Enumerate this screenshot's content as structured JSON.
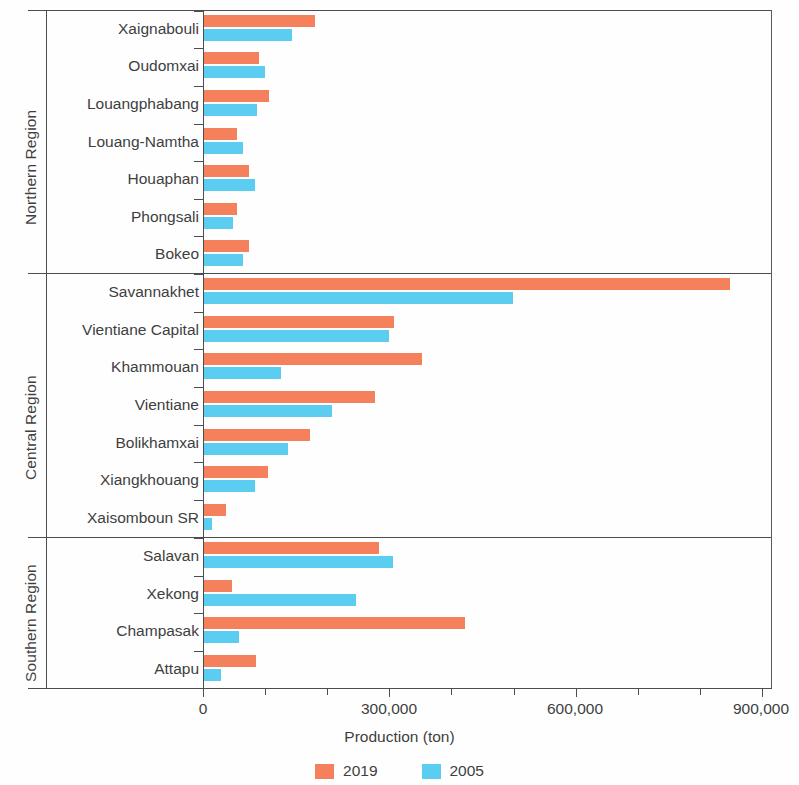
{
  "chart_data": {
    "type": "bar",
    "orientation": "horizontal",
    "title": "",
    "xlabel": "Production (ton)",
    "ylabel": "",
    "xlim": [
      0,
      900000
    ],
    "xticks": [
      0,
      100000,
      200000,
      300000,
      400000,
      500000,
      600000,
      700000,
      800000,
      900000
    ],
    "xtick_labels": [
      "0",
      "300,000",
      "600,000",
      "900,000"
    ],
    "major_xticks": [
      0,
      300000,
      600000,
      900000
    ],
    "grid": false,
    "legend_position": "bottom",
    "series": [
      {
        "name": "2019",
        "color": "#f4805c"
      },
      {
        "name": "2005",
        "color": "#5bcdf0"
      }
    ],
    "groups": [
      {
        "region": "Northern Region",
        "categories": [
          "Xaignabouli",
          "Oudomxai",
          "Louangphabang",
          "Louang-Namtha",
          "Houaphan",
          "Phongsali",
          "Bokeo"
        ],
        "values_2019": [
          178000,
          89000,
          104000,
          53000,
          72000,
          53000,
          72000
        ],
        "values_2005": [
          142000,
          98000,
          85000,
          63000,
          82000,
          47000,
          63000
        ]
      },
      {
        "region": "Central Region",
        "categories": [
          "Savannakhet",
          "Vientiane Capital",
          "Khammouan",
          "Vientiane",
          "Bolikhamxai",
          "Xiangkhouang",
          "Xaisomboun SR"
        ],
        "values_2019": [
          847000,
          306000,
          351000,
          275000,
          171000,
          103000,
          35000
        ],
        "values_2005": [
          497000,
          298000,
          124000,
          206000,
          135000,
          82000,
          13000
        ]
      },
      {
        "region": "Southern Region",
        "categories": [
          "Salavan",
          "Xekong",
          "Champasak",
          "Attapu"
        ],
        "values_2019": [
          282000,
          45000,
          420000,
          84000
        ],
        "values_2005": [
          304000,
          245000,
          56000,
          27000
        ]
      }
    ]
  },
  "axis": {
    "x_title": "Production (ton)",
    "tick_0": "0",
    "tick_300k": "300,000",
    "tick_600k": "600,000",
    "tick_900k": "900,000"
  },
  "legend": {
    "items": [
      {
        "label": "2019",
        "color": "#f4805c"
      },
      {
        "label": "2005",
        "color": "#5bcdf0"
      }
    ]
  },
  "regions": [
    {
      "label": "Northern Region"
    },
    {
      "label": "Central Region"
    },
    {
      "label": "Southern Region"
    }
  ]
}
